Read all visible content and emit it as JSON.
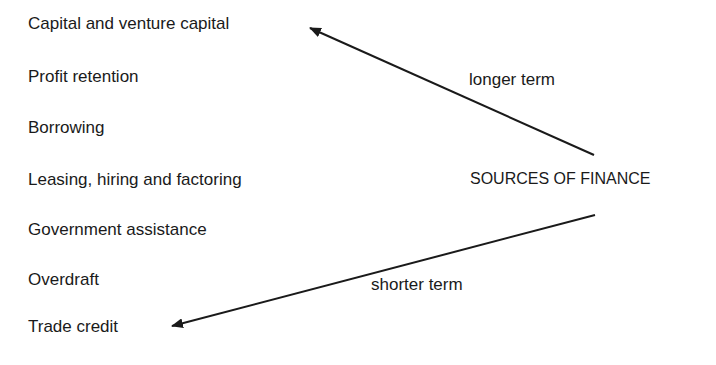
{
  "diagram": {
    "center_label": "SOURCES OF FINANCE",
    "arrows": [
      {
        "label": "longer term",
        "direction": "up-left",
        "target": "Capital and venture capital"
      },
      {
        "label": "shorter term",
        "direction": "down-left",
        "target": "Trade credit"
      }
    ],
    "sources": [
      "Capital and venture capital",
      "Profit retention",
      "Borrowing",
      "Leasing, hiring and factoring",
      "Government assistance",
      "Overdraft",
      "Trade credit"
    ]
  }
}
